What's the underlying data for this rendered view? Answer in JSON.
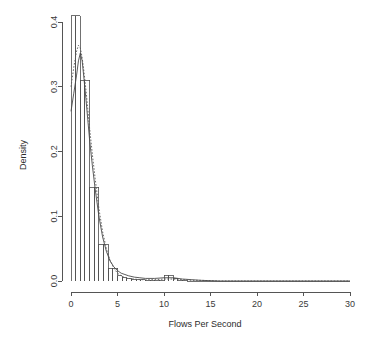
{
  "chart_data": {
    "type": "bar",
    "title": "",
    "subtitle": "",
    "xlabel": "Flows Per Second",
    "ylabel": "Density",
    "xlim": [
      0,
      30
    ],
    "ylim": [
      0.0,
      0.41
    ],
    "grid": false,
    "legend": "none",
    "x_ticks": [
      0,
      5,
      10,
      15,
      20,
      25,
      30
    ],
    "x_tick_labels": [
      "0",
      "5",
      "10",
      "15",
      "20",
      "25",
      "30"
    ],
    "y_ticks": [
      0.0,
      0.1,
      0.2,
      0.3,
      0.4
    ],
    "y_tick_labels": [
      "0.0",
      "0.1",
      "0.2",
      "0.3",
      "0.4"
    ],
    "bin_width": 0.5,
    "bin_edges": [
      0.0,
      0.5,
      1.0,
      1.5,
      2.0,
      2.5,
      3.0,
      3.5,
      4.0,
      4.5,
      5.0,
      5.5,
      6.0,
      6.5,
      7.0,
      7.5,
      8.0,
      8.5,
      9.0,
      9.5,
      10.0,
      10.5,
      11.0,
      11.5,
      12.0,
      12.5,
      13.0,
      13.5,
      14.0,
      14.5,
      15.0,
      30.0
    ],
    "categories": [
      "0-0.5",
      "0.5-1",
      "1-1.5",
      "1.5-2",
      "2-2.5",
      "2.5-3",
      "3-3.5",
      "3.5-4",
      "4-4.5",
      "4.5-5",
      "5-5.5",
      "5.5-6",
      "6-6.5",
      "6.5-7",
      "7-7.5",
      "7.5-8",
      "8-8.5",
      "8.5-9",
      "9-9.5",
      "9.5-10",
      "10-10.5",
      "10.5-11",
      "11-11.5",
      "11.5-12",
      "12-12.5",
      "12.5-13",
      "13-13.5",
      "13.5-14",
      "14-14.5",
      "14.5-15",
      "15-30"
    ],
    "values": [
      0.41,
      0.41,
      0.31,
      0.31,
      0.145,
      0.145,
      0.057,
      0.057,
      0.02,
      0.02,
      0.008,
      0.005,
      0.004,
      0.003,
      0.002,
      0.002,
      0.001,
      0.001,
      0.001,
      0.001,
      0.009,
      0.009,
      0.004,
      0.001,
      0.001,
      0.0,
      0.0,
      0.0,
      0.0,
      0.0,
      0.0
    ],
    "series": [
      {
        "name": "histogram",
        "type": "bar",
        "values": [
          0.41,
          0.41,
          0.31,
          0.31,
          0.145,
          0.145,
          0.057,
          0.057,
          0.02,
          0.02,
          0.008,
          0.005,
          0.004,
          0.003,
          0.002,
          0.002,
          0.001,
          0.001,
          0.001,
          0.001,
          0.009,
          0.009,
          0.004,
          0.001,
          0.001,
          0.0,
          0.0,
          0.0,
          0.0,
          0.0,
          0.0
        ]
      },
      {
        "name": "density-solid",
        "type": "line",
        "style": "solid",
        "x": [
          0.0,
          0.3,
          0.6,
          0.8,
          1.0,
          1.2,
          1.4,
          1.6,
          1.8,
          2.0,
          2.3,
          2.6,
          3.0,
          3.4,
          3.8,
          4.2,
          4.6,
          5.0,
          5.4,
          5.8,
          6.2,
          6.8,
          7.4,
          8.0,
          9.0,
          10.0,
          11.0,
          12.0,
          13.0,
          14.0,
          16.0,
          20.0,
          25.0,
          30.0
        ],
        "y": [
          0.262,
          0.29,
          0.318,
          0.34,
          0.352,
          0.34,
          0.312,
          0.282,
          0.25,
          0.218,
          0.178,
          0.142,
          0.1,
          0.068,
          0.046,
          0.031,
          0.022,
          0.016,
          0.012,
          0.01,
          0.008,
          0.006,
          0.005,
          0.004,
          0.004,
          0.005,
          0.005,
          0.003,
          0.002,
          0.001,
          0.0,
          0.0,
          0.0,
          0.0
        ]
      },
      {
        "name": "density-dotted",
        "type": "line",
        "style": "dotted",
        "x": [
          0.0,
          0.3,
          0.6,
          0.8,
          1.0,
          1.2,
          1.4,
          1.6,
          1.8,
          2.0,
          2.3,
          2.6,
          3.0,
          3.4,
          3.8,
          4.2,
          4.6,
          5.0,
          5.4,
          5.8,
          6.2,
          6.8,
          7.4,
          8.0,
          9.0,
          10.0,
          11.0,
          12.0,
          13.0,
          14.0,
          16.0,
          20.0,
          25.0,
          30.0
        ],
        "y": [
          0.3,
          0.33,
          0.355,
          0.364,
          0.36,
          0.345,
          0.322,
          0.296,
          0.266,
          0.236,
          0.195,
          0.158,
          0.112,
          0.076,
          0.05,
          0.032,
          0.02,
          0.012,
          0.008,
          0.005,
          0.004,
          0.003,
          0.002,
          0.002,
          0.002,
          0.003,
          0.003,
          0.002,
          0.001,
          0.001,
          0.0,
          0.0,
          0.0,
          0.0
        ]
      }
    ],
    "colors": {
      "axis": "#555555",
      "bar_stroke": "#4d4d4d",
      "curve_solid": "#4a4a4a",
      "curve_dotted": "#5a5a5a",
      "background": "#ffffff"
    }
  }
}
